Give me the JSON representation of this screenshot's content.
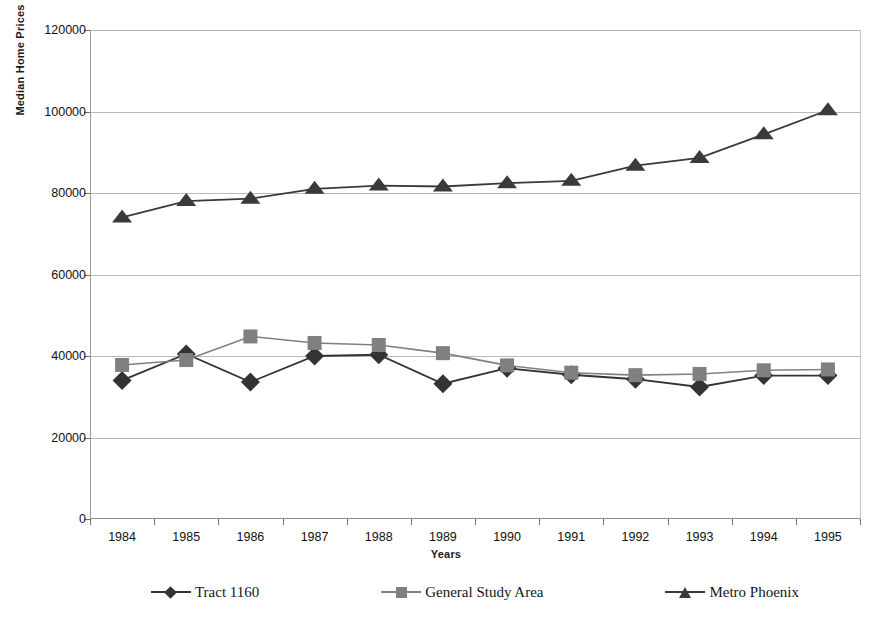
{
  "chart_data": {
    "type": "line",
    "title": "",
    "xlabel": "Years",
    "ylabel": "Median Home Prices",
    "categories": [
      "1984",
      "1985",
      "1986",
      "1987",
      "1988",
      "1989",
      "1990",
      "1991",
      "1992",
      "1993",
      "1994",
      "1995"
    ],
    "ylim": [
      0,
      120000
    ],
    "yticks": [
      0,
      20000,
      40000,
      60000,
      80000,
      100000,
      120000
    ],
    "ytick_labels": [
      "0",
      "20000",
      "40000",
      "60000",
      "80000",
      "100000",
      "120000"
    ],
    "grid": true,
    "legend_position": "bottom",
    "series": [
      {
        "name": "Tract 1160",
        "marker": "diamond",
        "color": "#333333",
        "values": [
          34000,
          40500,
          33600,
          40000,
          40300,
          33200,
          37000,
          35400,
          34300,
          32400,
          35200,
          35200
        ]
      },
      {
        "name": "General Study Area",
        "marker": "square",
        "color": "#808080",
        "values": [
          37800,
          39000,
          44800,
          43200,
          42700,
          40700,
          37700,
          35900,
          35300,
          35600,
          36500,
          36700
        ]
      },
      {
        "name": "Metro Phoenix",
        "marker": "triangle",
        "color": "#3a3a3a",
        "values": [
          74000,
          78000,
          78600,
          81000,
          81800,
          81600,
          82400,
          83000,
          86700,
          88600,
          94400,
          100300
        ]
      }
    ]
  },
  "axes": {
    "y_title": "Median Home Prices",
    "x_title": "Years"
  },
  "legend": {
    "items": [
      {
        "label": "Tract 1160",
        "marker": "diamond",
        "color": "#333333"
      },
      {
        "label": "General Study Area",
        "marker": "square",
        "color": "#808080"
      },
      {
        "label": "Metro Phoenix",
        "marker": "triangle",
        "color": "#3a3a3a"
      }
    ]
  },
  "colors": {
    "background": "#ffffff",
    "gridline": "#b9b9b9",
    "axis": "#8c8c8c",
    "text": "#111111"
  }
}
